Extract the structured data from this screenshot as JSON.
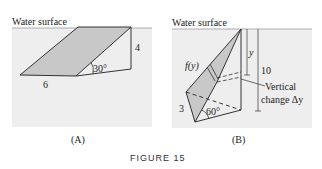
{
  "colors": {
    "water_bg": "#eeeeee",
    "plate_fill": "#c8c8c8",
    "line": "#333333",
    "surface_line": "#999999"
  },
  "panel_a": {
    "surface_label": "Water surface",
    "length_label": "6",
    "height_label": "4",
    "angle_label": "30°",
    "caption": "(A)"
  },
  "panel_b": {
    "surface_label": "Water surface",
    "depth_y_label": "y",
    "depth_total_label": "10",
    "width_func_label": "f(y)",
    "side_label": "3",
    "angle_label": "60°",
    "annotation_line1": "Vertical",
    "annotation_line2": "change Δy",
    "caption": "(B)"
  },
  "figure_title": "FIGURE 15"
}
